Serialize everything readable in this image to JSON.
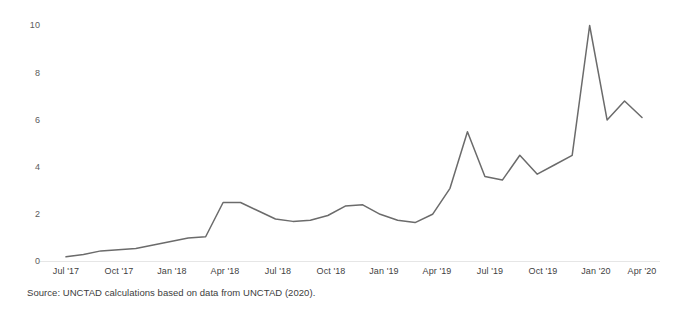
{
  "chart_data": {
    "type": "line",
    "title": "",
    "subtitle": "",
    "xlabel": "",
    "ylabel": "",
    "xlim": [
      "Jul '17",
      "Apr '20"
    ],
    "ylim": [
      0,
      10
    ],
    "grid": false,
    "legend": null,
    "legend_position": "none",
    "line_color": "#6b6b6b",
    "axis_color": "#e3e3e3",
    "y_ticks": [
      0,
      2,
      4,
      6,
      8,
      10
    ],
    "y_tick_labels": [
      "0",
      "2",
      "4",
      "6",
      "8",
      "10"
    ],
    "x_ticks": [
      "Jul '17",
      "Oct '17",
      "Jan '18",
      "Apr '18",
      "Jul '18",
      "Oct '18",
      "Jan '19",
      "Apr '19",
      "Jul '19",
      "Oct '19",
      "Jan '20",
      "Apr '20"
    ],
    "x": [
      "Jul '17",
      "Aug '17",
      "Sep '17",
      "Oct '17",
      "Nov '17",
      "Dec '17",
      "Jan '18",
      "Feb '18",
      "Mar '18",
      "Apr '18",
      "May '18",
      "Jun '18",
      "Jul '18",
      "Aug '18",
      "Sep '18",
      "Oct '18",
      "Nov '18",
      "Dec '18",
      "Jan '19",
      "Feb '19",
      "Mar '19",
      "Apr '19",
      "May '19",
      "Jun '19",
      "Jul '19",
      "Aug '19",
      "Sep '19",
      "Oct '19",
      "Nov '19",
      "Dec '19",
      "Jan '20",
      "Feb '20",
      "Mar '20",
      "Apr '20"
    ],
    "values": [
      0.2,
      0.3,
      0.45,
      0.5,
      0.55,
      0.7,
      0.85,
      1.0,
      1.05,
      2.5,
      2.5,
      2.15,
      1.8,
      1.7,
      1.75,
      1.95,
      2.35,
      2.4,
      2.0,
      1.75,
      1.65,
      2.0,
      3.1,
      5.5,
      3.6,
      3.45,
      4.5,
      3.7,
      4.1,
      4.5,
      10.0,
      6.0,
      6.8,
      6.1
    ],
    "series": [
      {
        "name": "value",
        "values": [
          0.2,
          0.3,
          0.45,
          0.5,
          0.55,
          0.7,
          0.85,
          1.0,
          1.05,
          2.5,
          2.5,
          2.15,
          1.8,
          1.7,
          1.75,
          1.95,
          2.35,
          2.4,
          2.0,
          1.75,
          1.65,
          2.0,
          3.1,
          5.5,
          3.6,
          3.45,
          4.5,
          3.7,
          4.1,
          4.5,
          10.0,
          6.0,
          6.8,
          6.1
        ]
      }
    ],
    "final_value": 5.0
  },
  "footer": {
    "source_note": "Source: UNCTAD calculations based on data from UNCTAD (2020)."
  }
}
